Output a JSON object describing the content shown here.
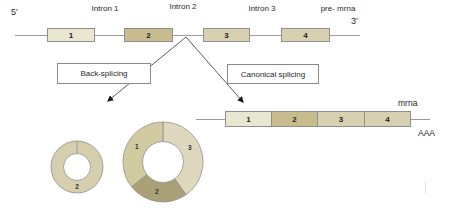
{
  "figure": {
    "pre_mrna": {
      "five_prime_label": "5′",
      "three_prime_label": "3′",
      "track_label": "pre- mrna",
      "introns": [
        "Intron 1",
        "Intron 2",
        "Intron 3"
      ],
      "exons": [
        {
          "label": "1",
          "color": "#eae7d0"
        },
        {
          "label": "2",
          "color": "#c8bb8d"
        },
        {
          "label": "3",
          "color": "#d7d1b2"
        },
        {
          "label": "4",
          "color": "#d7d1b2"
        }
      ]
    },
    "branches": {
      "left_label": "Back-splicing",
      "right_label": "Canonical splicing"
    },
    "mrna": {
      "track_label": "mrna",
      "poly_a_label": "AAA",
      "exons": [
        {
          "label": "1",
          "color": "#eae7d0"
        },
        {
          "label": "2",
          "color": "#c8bb8d"
        },
        {
          "label": "3",
          "color": "#d7d1b2"
        },
        {
          "label": "4",
          "color": "#d7d1b2"
        }
      ]
    },
    "circles": [
      {
        "name": "circrna-small",
        "cx": 77,
        "cy": 167,
        "r_outer": 26,
        "r_inner": 13.5,
        "segments": [
          {
            "label": "2",
            "color": "#d5cfae",
            "start": 0,
            "end": 360,
            "label_angle": 180
          }
        ]
      },
      {
        "name": "circrna-large",
        "cx": 163,
        "cy": 162,
        "r_outer": 40,
        "r_inner": 20.5,
        "segments": [
          {
            "label": "3",
            "color": "#ddd8be",
            "start": 0,
            "end": 145,
            "label_angle": 62
          },
          {
            "label": "2",
            "color": "#a9a078",
            "start": 145,
            "end": 232,
            "label_angle": 192
          },
          {
            "label": "1",
            "color": "#d2cba2",
            "start": 232,
            "end": 360,
            "label_angle": 300
          }
        ]
      }
    ],
    "colors": {
      "track_line": "#9b9b9b",
      "arrow": "#3f3f3f",
      "box_border": "#8f8f8f",
      "donut_stroke": "#8f8f8f"
    }
  }
}
